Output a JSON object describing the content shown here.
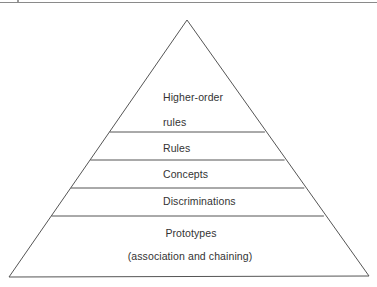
{
  "diagram": {
    "type": "pyramid",
    "levels": [
      {
        "label": "Higher-order",
        "label_line2": "rules"
      },
      {
        "label": "Rules"
      },
      {
        "label": "Concepts"
      },
      {
        "label": "Discriminations"
      },
      {
        "label": "Prototypes",
        "label_line2": "(association and chaining)"
      }
    ],
    "colors": {
      "line": "#555555",
      "text": "#333333",
      "background": "#ffffff"
    }
  }
}
